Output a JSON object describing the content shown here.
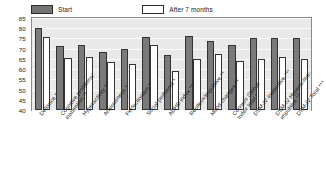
{
  "chart_data": {
    "type": "bar",
    "title": "",
    "subtitle": "",
    "xlabel": "",
    "ylabel": "",
    "ylim": [
      40,
      85
    ],
    "ytick_step": 5,
    "yticks": [
      85,
      80,
      75,
      70,
      65,
      60,
      55,
      50,
      45,
      40
    ],
    "grid": true,
    "legend_position": "top",
    "categories": [
      "Defiance *",
      "Cognitive problems/ inattention **",
      "Hyperactivity **",
      "Anxiousness *",
      "Perfectionism *",
      "Social problems *",
      "ADHD index ***",
      "Restless/impulsive **",
      "Mood changes **",
      "Conners Global Index total *",
      "DSM-IV inattentive ***",
      "DSM-IV Hyperactive-impulsive **",
      "DSM-IV Total ***"
    ],
    "category_lines": [
      [
        "Defiance *"
      ],
      [
        "Cognitive problems/",
        "inattention **"
      ],
      [
        "Hyperactivity **"
      ],
      [
        "Anxiousness *"
      ],
      [
        "Perfectionism *"
      ],
      [
        "Social problems *"
      ],
      [
        "ADHD index ***"
      ],
      [
        "Restless/impulsive **"
      ],
      [
        "Mood changes **"
      ],
      [
        "Conners Global",
        "Index total *"
      ],
      [
        "DSM-IV inattentive ***"
      ],
      [
        "DSM-IV Hyperactive-",
        "impulsive **"
      ],
      [
        "DSM-IV Total ***"
      ]
    ],
    "series": [
      {
        "name": "Start",
        "color": "#7a7a7a",
        "values": [
          80.0,
          71.5,
          72.0,
          68.5,
          70.0,
          75.5,
          67.0,
          76.0,
          74.0,
          72.0,
          75.0,
          75.0,
          75.0
        ]
      },
      {
        "name": "After 7 months",
        "color": "#ffffff",
        "values": [
          75.5,
          65.5,
          66.0,
          63.5,
          62.5,
          72.0,
          59.0,
          65.0,
          67.5,
          64.0,
          65.0,
          66.0,
          65.0
        ]
      }
    ]
  },
  "legend": {
    "entries": [
      {
        "label": "Start",
        "style": "dark"
      },
      {
        "label": "After 7 months",
        "style": "light"
      }
    ]
  },
  "colors": {
    "start_bar": "#7a7a7a",
    "after_bar": "#ffffff",
    "bar_outline": "#333333",
    "plot_background": "#e9e9e9",
    "gridline": "#fbfbfb",
    "frame": "#8a8a8a",
    "text": "#1a1a1a"
  }
}
